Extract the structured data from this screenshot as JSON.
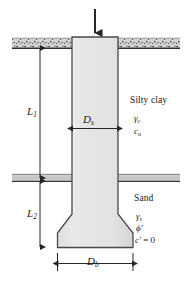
{
  "figure": {
    "type": "drilled-shaft-foundation-cross-section",
    "colors": {
      "shaft_fill": "#e4e4e4",
      "shaft_stroke": "#4a4a4a",
      "soil_band": "#c9c9c9",
      "ground_line": "#3a3a3a",
      "text": "#1a1a1a",
      "arrow": "#2b2b2b",
      "background": "#ffffff"
    },
    "load": {
      "name": "applied-load-arrow",
      "direction": "down"
    },
    "layers": [
      {
        "id": "upper",
        "name": "Silty clay",
        "properties": [
          {
            "symbol": "gamma",
            "subscript": "c",
            "text": "γc"
          },
          {
            "symbol": "c",
            "subscript": "u",
            "text": "cu"
          }
        ]
      },
      {
        "id": "lower",
        "name": "Sand",
        "properties": [
          {
            "symbol": "gamma",
            "subscript": "s",
            "text": "γs"
          },
          {
            "symbol": "phi",
            "prime": true,
            "text": "ϕ′"
          },
          {
            "symbol": "c",
            "prime": true,
            "value": "0",
            "text": "c′ = 0"
          }
        ]
      }
    ],
    "dimensions": [
      {
        "id": "L1",
        "label": "L",
        "subscript": "1",
        "orientation": "vertical",
        "description": "depth of shaft within silty clay layer"
      },
      {
        "id": "L2",
        "label": "L",
        "subscript": "2",
        "orientation": "vertical",
        "description": "depth of shaft within sand layer"
      },
      {
        "id": "Ds",
        "label": "D",
        "subscript": "s",
        "orientation": "horizontal",
        "description": "shaft diameter"
      },
      {
        "id": "Db",
        "label": "D",
        "subscript": "b",
        "orientation": "horizontal",
        "description": "bell base diameter"
      }
    ],
    "soil_labels": {
      "silty_clay": "Silty clay",
      "sand": "Sand"
    }
  }
}
